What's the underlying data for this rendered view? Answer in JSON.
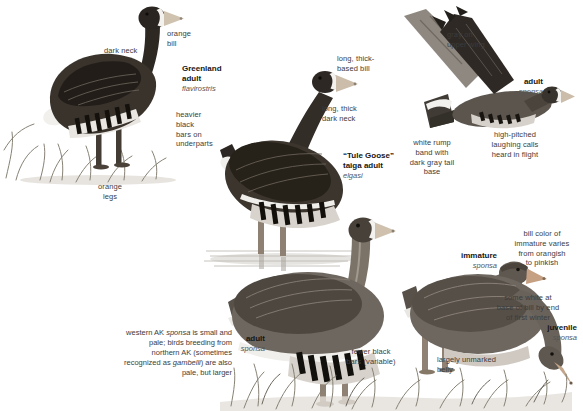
{
  "palette": {
    "ink": "#3c3c3c",
    "name_ink": "#161616",
    "subspecies_ink": "#555555",
    "body_dark": "#39332c",
    "body_mid": "#6e675f",
    "wing_dark": "#4d4740",
    "bill_pale": "#cfc2ae",
    "bill_pink": "#c5a083",
    "white_patch": "#f3f2ee",
    "bar_black": "#14110d",
    "legs": "#8f8174",
    "grass": "#878275",
    "water": "#b9b5af"
  },
  "figures": {
    "greenland_adult": {
      "title": "Greenland\nadult",
      "subspecies": "flavirostris",
      "callouts": {
        "dark_neck": "dark neck",
        "orange_bill": "orange\nbill",
        "heavier_bars": "heavier\nblack\nbars on\nunderparts",
        "orange_legs": "orange\nlegs"
      }
    },
    "tule_goose": {
      "title": "“Tule Goose”\ntaiga adult",
      "subspecies": "elgasi",
      "callouts": {
        "thick_based_bill": "long, thick-\nbased bill",
        "thick_dark_neck": "long, thick\ndark neck"
      }
    },
    "flying_adult": {
      "title": "adult",
      "subspecies": "sponsa",
      "callouts": {
        "gray_upper_wing": "gray on\nupper wing",
        "white_rump": "white rump\nband with\ndark gray tail\nbase",
        "laughing_calls": "high-pitched\nlaughing calls\nheard in flight"
      }
    },
    "immature": {
      "title": "immature",
      "subspecies": "sponsa",
      "callouts": {
        "bill_color": "bill color of\nimmature varies\nfrom orangish\nto pinkish",
        "some_white": "some white at\nbase of bill by end\nof first winter"
      }
    },
    "adult_sponsa": {
      "title": "adult",
      "subspecies": "sponsa",
      "callouts": {
        "fewer_bars": "fewer black\nbars (variable)"
      }
    },
    "juvenile": {
      "title": "juvenile",
      "subspecies": "sponsa",
      "callouts": {
        "unmarked_belly": "largely unmarked\nbelly"
      }
    },
    "note_western_ak": {
      "part1": "western AK ",
      "italic1": "sponsa",
      "part2": " is small and pale; birds breeding from northern AK (sometimes recognized as ",
      "italic2": "gambelli",
      "part3": ") are also pale, but larger"
    }
  }
}
